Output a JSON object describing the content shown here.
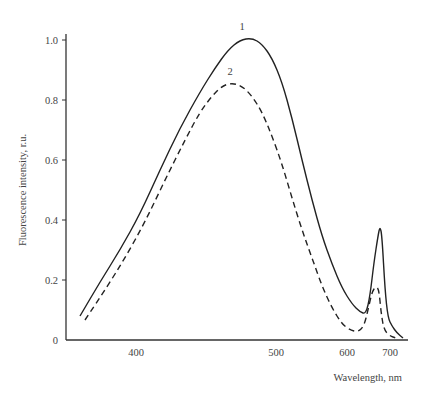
{
  "chart_data": {
    "type": "line",
    "title": "",
    "xlabel": "Wavelength, nm",
    "ylabel": "Fluorescence intensity, r.u.",
    "x_ticks": [
      {
        "label": "400",
        "px": 136
      },
      {
        "label": "500",
        "px": 276
      },
      {
        "label": "600",
        "px": 347
      },
      {
        "label": "700",
        "px": 390
      }
    ],
    "y_ticks": [
      {
        "label": "0",
        "value": 0
      },
      {
        "label": "0.2",
        "value": 0.2
      },
      {
        "label": "0.4",
        "value": 0.4
      },
      {
        "label": "0.6",
        "value": 0.6
      },
      {
        "label": "0.8",
        "value": 0.8
      },
      {
        "label": "1.0",
        "value": 1.0
      }
    ],
    "ylim": [
      0,
      1.0
    ],
    "grid": false,
    "legend": "curve numbers placed above peaks",
    "series": [
      {
        "name": "1",
        "style": "solid",
        "label_pos": {
          "x": 242,
          "y": 30
        },
        "points_px": [
          [
            80,
            316
          ],
          [
            100,
            282
          ],
          [
            120,
            250
          ],
          [
            140,
            214
          ],
          [
            160,
            170
          ],
          [
            180,
            128
          ],
          [
            200,
            92
          ],
          [
            215,
            68
          ],
          [
            228,
            50
          ],
          [
            240,
            40
          ],
          [
            252,
            38
          ],
          [
            262,
            44
          ],
          [
            272,
            58
          ],
          [
            282,
            82
          ],
          [
            292,
            118
          ],
          [
            302,
            160
          ],
          [
            312,
            200
          ],
          [
            322,
            236
          ],
          [
            332,
            264
          ],
          [
            342,
            288
          ],
          [
            352,
            304
          ],
          [
            360,
            312
          ],
          [
            366,
            314
          ],
          [
            370,
            296
          ],
          [
            374,
            262
          ],
          [
            378,
            236
          ],
          [
            380,
            226
          ],
          [
            382,
            236
          ],
          [
            385,
            290
          ],
          [
            388,
            318
          ],
          [
            392,
            326
          ],
          [
            397,
            333
          ],
          [
            403,
            338
          ]
        ],
        "approx_values": [
          {
            "wavelength": 400,
            "intensity": 0.42
          },
          {
            "wavelength": 475,
            "intensity": 1.01
          },
          {
            "wavelength": 500,
            "intensity": 0.95
          },
          {
            "wavelength": 640,
            "intensity": 0.08
          },
          {
            "wavelength": 680,
            "intensity": 0.38
          },
          {
            "wavelength": 720,
            "intensity": 0.01
          }
        ]
      },
      {
        "name": "2",
        "style": "dashed",
        "label_pos": {
          "x": 230,
          "y": 75
        },
        "points_px": [
          [
            85,
            320
          ],
          [
            105,
            290
          ],
          [
            125,
            258
          ],
          [
            145,
            222
          ],
          [
            165,
            180
          ],
          [
            185,
            140
          ],
          [
            200,
            112
          ],
          [
            212,
            96
          ],
          [
            222,
            86
          ],
          [
            232,
            83
          ],
          [
            242,
            86
          ],
          [
            252,
            96
          ],
          [
            262,
            112
          ],
          [
            272,
            136
          ],
          [
            282,
            164
          ],
          [
            292,
            198
          ],
          [
            302,
            230
          ],
          [
            312,
            258
          ],
          [
            322,
            286
          ],
          [
            332,
            308
          ],
          [
            342,
            324
          ],
          [
            350,
            330
          ],
          [
            358,
            332
          ],
          [
            364,
            326
          ],
          [
            368,
            310
          ],
          [
            372,
            292
          ],
          [
            376,
            286
          ],
          [
            379,
            290
          ],
          [
            381,
            312
          ],
          [
            384,
            330
          ],
          [
            390,
            336
          ],
          [
            396,
            338
          ]
        ],
        "approx_values": [
          {
            "wavelength": 400,
            "intensity": 0.36
          },
          {
            "wavelength": 470,
            "intensity": 0.86
          },
          {
            "wavelength": 500,
            "intensity": 0.72
          },
          {
            "wavelength": 635,
            "intensity": 0.02
          },
          {
            "wavelength": 678,
            "intensity": 0.18
          },
          {
            "wavelength": 710,
            "intensity": 0.01
          }
        ]
      }
    ],
    "layout": {
      "axis_x_left": 66,
      "axis_x_right": 408,
      "y_zero_px": 340,
      "y_one_px": 40,
      "ylabel_x": 26,
      "ylabel_y": 190,
      "xlabel_x": 402,
      "xlabel_y": 381
    }
  }
}
